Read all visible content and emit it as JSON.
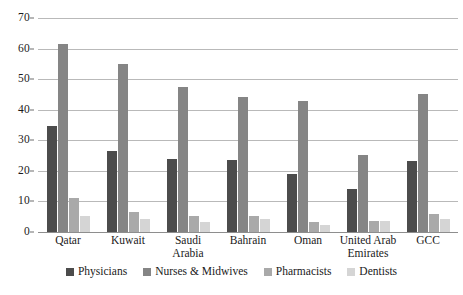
{
  "chart_data": {
    "type": "bar",
    "title": "",
    "subtitle": "",
    "xlabel": "",
    "ylabel": "",
    "ylim": [
      0,
      70
    ],
    "ytick_step": 10,
    "yticks": [
      "0",
      "10",
      "20",
      "30",
      "40",
      "50",
      "60",
      "70"
    ],
    "grid": true,
    "legend_position": "bottom",
    "categories": [
      "Qatar",
      "Kuwait",
      "Saudi Arabia",
      "Bahrain",
      "Oman",
      "United Arab Emirates",
      "GCC"
    ],
    "series": [
      {
        "name": "Physicians",
        "color": "#4c4c4c",
        "values": [
          34.8,
          26.5,
          23.8,
          23.7,
          19.0,
          14.0,
          23.2
        ]
      },
      {
        "name": "Nurses & Midwives",
        "color": "#858585",
        "values": [
          61.5,
          55.0,
          47.3,
          44.2,
          42.8,
          25.1,
          45.3
        ]
      },
      {
        "name": "Pharmacists",
        "color": "#a9a9a9",
        "values": [
          11.2,
          6.5,
          5.3,
          5.2,
          3.3,
          3.6,
          6.0
        ]
      },
      {
        "name": "Dentists",
        "color": "#d5d5d5",
        "values": [
          5.2,
          4.3,
          3.4,
          4.4,
          2.2,
          3.6,
          4.3
        ]
      }
    ]
  }
}
